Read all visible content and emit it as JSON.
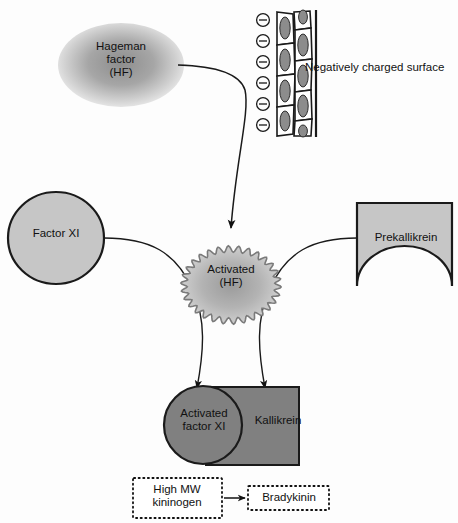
{
  "diagram": {
    "nodes": {
      "hageman_factor": {
        "label": "Hageman\nfactor\n(HF)",
        "shape": "ellipse-gradient",
        "fill": "#9a9a9a"
      },
      "negatively_charged_surface": {
        "label": "Negatively charged surface",
        "shape": "endothelial-wall",
        "charge_symbol": "⊖",
        "charge_count": 6,
        "cell_fill": "#ffffff",
        "nucleus_fill": "#8c8c8c"
      },
      "factor_xi": {
        "label": "Factor XI",
        "shape": "ellipse",
        "fill": "#c6c6c6",
        "stroke": "#1a1a1a"
      },
      "activated_hf": {
        "label": "Activated\n(HF)",
        "shape": "scalloped-ellipse",
        "fill": "#b5b5b5",
        "stroke": "#6e6e6e"
      },
      "prekallikrein": {
        "label": "Prekallikrein",
        "shape": "rect-with-bottom-notch",
        "fill": "#c6c6c6",
        "stroke": "#1a1a1a"
      },
      "activated_factor_xi": {
        "label": "Activated\nfactor XI",
        "shape": "circle",
        "fill": "#808080",
        "stroke": "#1a1a1a"
      },
      "kallikrein": {
        "label": "Kallikrein",
        "shape": "rect",
        "fill": "#808080",
        "stroke": "#1a1a1a"
      },
      "high_mw_kininogen": {
        "label": "High MW\nkininogen",
        "shape": "dotted-box",
        "fill": "#ffffff",
        "stroke": "#111111"
      },
      "bradykinin": {
        "label": "Bradykinin",
        "shape": "dotted-box",
        "fill": "#ffffff",
        "stroke": "#111111"
      }
    },
    "edges": [
      {
        "from": "hageman_factor",
        "to": "activated_hf",
        "style": "curved-arrow"
      },
      {
        "from": "factor_xi",
        "to": "activated_factor_xi",
        "style": "curved-line-through-activated-hf"
      },
      {
        "from": "prekallikrein",
        "to": "kallikrein",
        "style": "curved-line-through-activated-hf"
      },
      {
        "from": "high_mw_kininogen",
        "to": "bradykinin",
        "style": "straight-arrow"
      }
    ],
    "colors": {
      "background": "#fdfdfd",
      "ink": "#111111",
      "light_gray": "#c6c6c6",
      "mid_gray": "#808080",
      "dark_gray": "#4a4a4a"
    }
  }
}
